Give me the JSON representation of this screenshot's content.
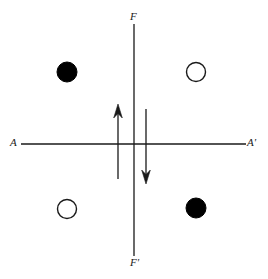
{
  "figure": {
    "background_color": "#ffffff",
    "stroke_color": "#1a1a1a",
    "fill_color": "#000000",
    "width": 268,
    "height": 279
  },
  "axes": {
    "vertical": {
      "name": "F-F-prime-axis",
      "x": 134,
      "y_top": 24,
      "y_bottom": 256,
      "label_top": "F",
      "label_bottom": "F'"
    },
    "horizontal": {
      "name": "A-A-prime-axis",
      "y": 144,
      "x_left": 21,
      "x_right": 246,
      "label_left": "A",
      "label_right": "A'"
    }
  },
  "circles": [
    {
      "name": "circle-top-left",
      "cx": 67,
      "cy": 72,
      "r": 10,
      "style": "filled"
    },
    {
      "name": "circle-top-right",
      "cx": 196,
      "cy": 72,
      "r": 9.5,
      "style": "open"
    },
    {
      "name": "circle-bottom-left",
      "cx": 67,
      "cy": 209,
      "r": 9.5,
      "style": "open"
    },
    {
      "name": "circle-bottom-right",
      "cx": 196,
      "cy": 208,
      "r": 10,
      "style": "filled"
    }
  ],
  "arrows": [
    {
      "name": "arrow-up-left",
      "direction": "up",
      "x": 118,
      "y_tail": 179,
      "y_head": 104
    },
    {
      "name": "arrow-down-right",
      "direction": "down",
      "x": 146,
      "y_tail": 109,
      "y_head": 184
    }
  ]
}
